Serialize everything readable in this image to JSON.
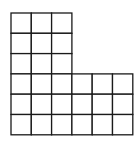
{
  "diagram": {
    "type": "l-shaped-grid",
    "line_color": "#1a1a1a",
    "background": "#ffffff",
    "cell_size": 20.3,
    "origin": {
      "x": 11,
      "y": 13
    },
    "sections": [
      {
        "name": "top-block",
        "cols": 3,
        "rows": 3,
        "col_offset": 0,
        "row_offset": 0
      },
      {
        "name": "bottom-block",
        "cols": 6,
        "rows": 3,
        "col_offset": 0,
        "row_offset": 3
      }
    ],
    "total_cells": 27
  }
}
